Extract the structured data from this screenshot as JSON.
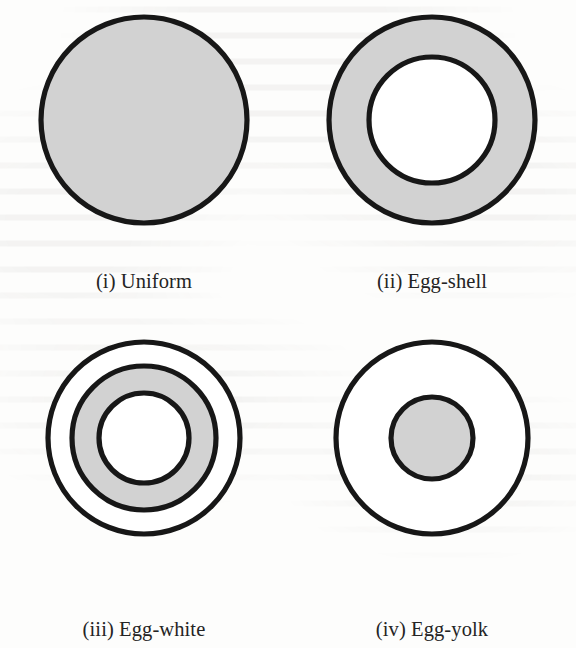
{
  "figure": {
    "background_color": "#fdfdfc",
    "ink_color": "#171717",
    "shaded_color": "#d2d2d2",
    "blank_color": "#ffffff",
    "columns": 2,
    "rows": 2
  },
  "panels": [
    {
      "id": "uniform",
      "caption": "(i) Uniform",
      "pattern": "uniform",
      "outer_radius": 103,
      "shaded_bands": [
        [
          0,
          103
        ]
      ],
      "blank_bands": [],
      "boundary_radii": [
        103
      ]
    },
    {
      "id": "egg-shell",
      "caption": "(ii) Egg-shell",
      "pattern": "egg-shell",
      "outer_radius": 103,
      "shaded_bands": [
        [
          63,
          103
        ]
      ],
      "blank_bands": [
        [
          0,
          63
        ]
      ],
      "boundary_radii": [
        103,
        63
      ]
    },
    {
      "id": "egg-white",
      "caption": "(iii) Egg-white",
      "pattern": "egg-white",
      "outer_radius": 96,
      "shaded_bands": [
        [
          45,
          72
        ]
      ],
      "blank_bands": [
        [
          0,
          45
        ],
        [
          72,
          96
        ]
      ],
      "boundary_radii": [
        96,
        72,
        45
      ]
    },
    {
      "id": "egg-yolk",
      "caption": "(iv) Egg-yolk",
      "pattern": "egg-yolk",
      "outer_radius": 96,
      "shaded_bands": [
        [
          0,
          41
        ]
      ],
      "blank_bands": [
        [
          41,
          96
        ]
      ],
      "boundary_radii": [
        96,
        41
      ]
    }
  ],
  "chart_data": {
    "type": "diagram",
    "title": "",
    "subtitle": "",
    "series": [
      {
        "name": "(i) Uniform",
        "shaded_fraction_of_radius": [
          [
            0.0,
            1.0
          ]
        ]
      },
      {
        "name": "(ii) Egg-shell",
        "shaded_fraction_of_radius": [
          [
            0.61,
            1.0
          ]
        ]
      },
      {
        "name": "(iii) Egg-white",
        "shaded_fraction_of_radius": [
          [
            0.47,
            0.75
          ]
        ]
      },
      {
        "name": "(iv) Egg-yolk",
        "shaded_fraction_of_radius": [
          [
            0.0,
            0.43
          ]
        ]
      }
    ],
    "legend_position": "none",
    "grid": false
  }
}
